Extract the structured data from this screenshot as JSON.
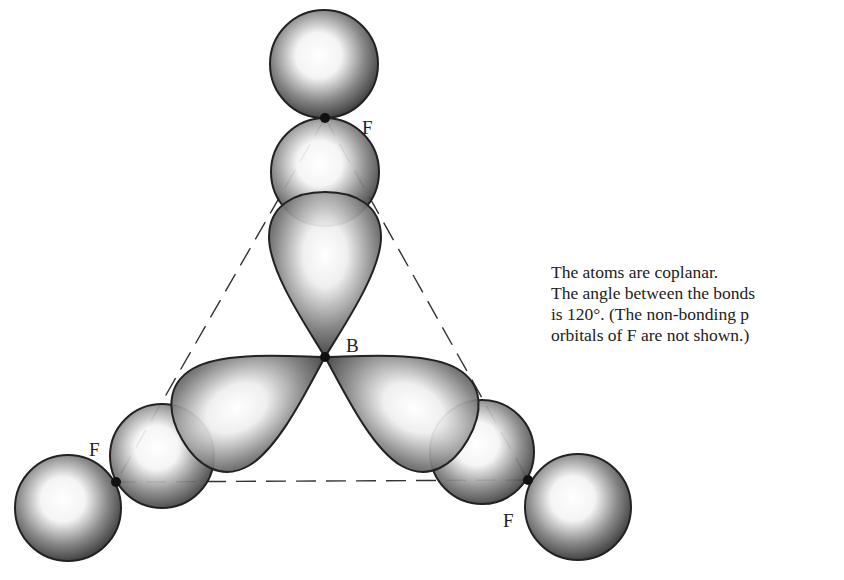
{
  "labels": {
    "central_atom": "B",
    "fluorine_top": "F",
    "fluorine_left": "F",
    "fluorine_right": "F"
  },
  "caption": {
    "lines": [
      "The atoms are coplanar.",
      "The angle between the bonds",
      "is 120°. (The  non-bonding p",
      "orbitals of F are  not shown.)"
    ]
  },
  "geometry": {
    "bond_angle_deg": 120,
    "nuclei": {
      "B": [
        325,
        357
      ],
      "F_top": [
        325,
        118
      ],
      "F_left": [
        116,
        482
      ],
      "F_right": [
        528,
        480
      ]
    }
  },
  "colors": {
    "outline": "#222222",
    "shade_dark": "#4a4a4a",
    "shade_light": "#ffffff",
    "background": "#ffffff"
  }
}
